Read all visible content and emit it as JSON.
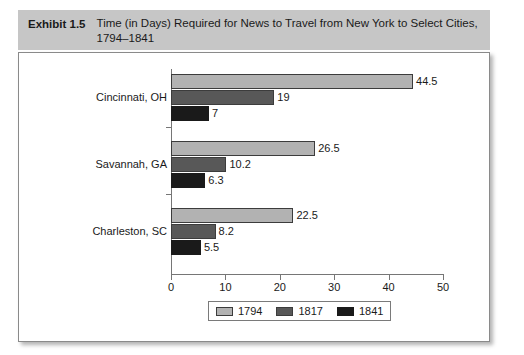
{
  "exhibit": {
    "label": "Exhibit 1.5",
    "title": "Time (in Days) Required for News to Travel from New York to Select Cities, 1794–1841"
  },
  "chart_data": {
    "type": "bar",
    "orientation": "horizontal",
    "title": "Time (in Days) Required for News to Travel from New York to Select Cities, 1794–1841",
    "xlabel": "",
    "ylabel": "",
    "categories": [
      "Cincinnati, OH",
      "Savannah, GA",
      "Charleston, SC"
    ],
    "series": [
      {
        "name": "1794",
        "color": "#b2b2b2",
        "values": [
          44.5,
          26.5,
          22.5
        ]
      },
      {
        "name": "1817",
        "color": "#585858",
        "values": [
          19,
          10.2,
          8.2
        ]
      },
      {
        "name": "1841",
        "color": "#1a1a1a",
        "values": [
          7,
          6.3,
          5.5
        ]
      }
    ],
    "value_labels": [
      [
        "44.5",
        "19",
        "7"
      ],
      [
        "26.5",
        "10.2",
        "6.3"
      ],
      [
        "22.5",
        "8.2",
        "5.5"
      ]
    ],
    "xlim": [
      0,
      50
    ],
    "xticks": [
      0,
      10,
      20,
      30,
      40,
      50
    ],
    "xtick_labels": [
      "0",
      "10",
      "20",
      "30",
      "40",
      "50"
    ],
    "grid": false,
    "legend_position": "bottom"
  }
}
